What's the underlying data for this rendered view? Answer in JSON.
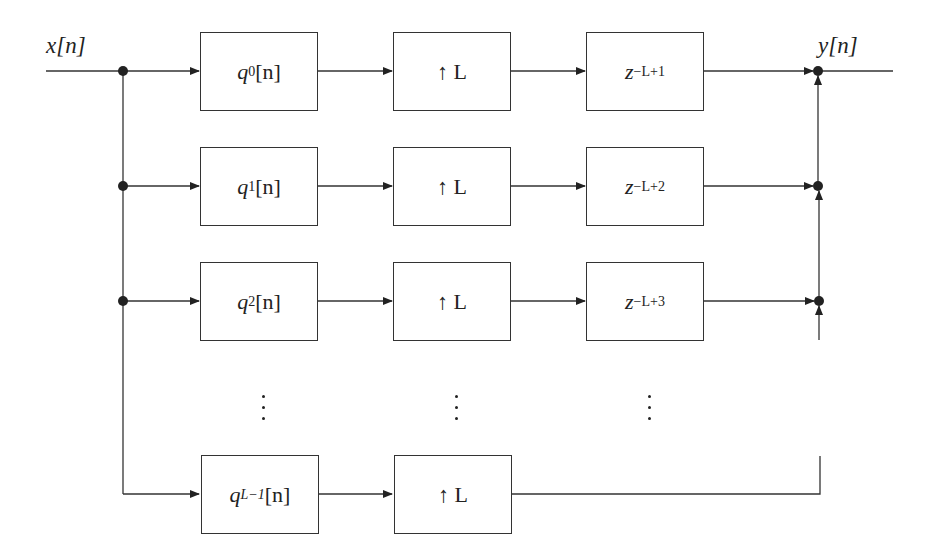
{
  "diagram": {
    "type": "block-diagram",
    "input_label": "x[n]",
    "output_label": "y[n]",
    "rows": [
      {
        "filter": {
          "base": "q",
          "sub": "0",
          "tail": "[n]"
        },
        "upsampler": "↑ L",
        "delay": {
          "base": "z",
          "exp": "−L+1"
        }
      },
      {
        "filter": {
          "base": "q",
          "sub": "1",
          "tail": "[n]"
        },
        "upsampler": "↑ L",
        "delay": {
          "base": "z",
          "exp": "−L+2"
        }
      },
      {
        "filter": {
          "base": "q",
          "sub": "2",
          "tail": "[n]"
        },
        "upsampler": "↑ L",
        "delay": {
          "base": "z",
          "exp": "−L+3"
        }
      },
      {
        "filter": {
          "base": "q",
          "sub": "L−1",
          "tail": "[n]"
        },
        "upsampler": "↑ L",
        "delay": null
      }
    ],
    "ellipsis": "⋮",
    "colors": {
      "stroke": "#333333",
      "background": "#ffffff"
    }
  }
}
